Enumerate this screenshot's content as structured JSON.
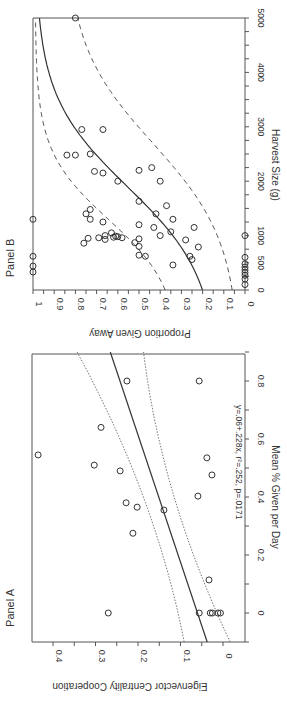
{
  "figure": {
    "orientation": "rotated 90 degrees clockwise"
  },
  "chart_data": [
    {
      "type": "scatter",
      "panel": "Panel A",
      "title": "Panel A",
      "xlabel": "Mean % Given per Day",
      "ylabel": "Eigenvector Centrality Cooperation",
      "xlim": [
        -0.1,
        0.9
      ],
      "ylim": [
        -0.04,
        0.44
      ],
      "xticks": [
        "0",
        "0.2",
        "0.4",
        "0.6",
        "0.8"
      ],
      "yticks": [
        "0",
        "0.1",
        "0.2",
        "0.3",
        "0.4"
      ],
      "annotation": "y=.06+.228x, r²=.252, p=.0171",
      "fit": {
        "type": "linear",
        "intercept": 0.06,
        "slope": 0.228,
        "line_style": "solid"
      },
      "confidence_band": {
        "line_style": "dotted"
      },
      "points": [
        {
          "x": 0.8,
          "y": 0.226
        },
        {
          "x": 0.8,
          "y": 0.056
        },
        {
          "x": 0.545,
          "y": 0.435
        },
        {
          "x": 0.64,
          "y": 0.287
        },
        {
          "x": 0.51,
          "y": 0.303
        },
        {
          "x": 0.49,
          "y": 0.242
        },
        {
          "x": 0.38,
          "y": 0.228
        },
        {
          "x": 0.365,
          "y": 0.202
        },
        {
          "x": 0.275,
          "y": 0.212
        },
        {
          "x": 0.355,
          "y": 0.139
        },
        {
          "x": 0.403,
          "y": 0.059
        },
        {
          "x": 0.535,
          "y": 0.038
        },
        {
          "x": 0.476,
          "y": 0.026
        },
        {
          "x": 0.114,
          "y": 0.033
        },
        {
          "x": 0.0,
          "y": 0.27
        },
        {
          "x": 0.0,
          "y": 0.056
        },
        {
          "x": 0.0,
          "y": 0.03
        },
        {
          "x": 0.0,
          "y": 0.025
        },
        {
          "x": 0.0,
          "y": 0.012
        },
        {
          "x": 0.0,
          "y": 0.006
        }
      ]
    },
    {
      "type": "scatter",
      "panel": "Panel B",
      "title": "Panel B",
      "xlabel": "Harvest Size (g)",
      "ylabel": "Proportion Given Away",
      "xlim": [
        0,
        5000
      ],
      "ylim": [
        0,
        1
      ],
      "xticks": [
        "0",
        "500",
        "1000",
        "2000",
        "3000",
        "4000",
        "5000"
      ],
      "yticks": [
        "0",
        "0.1",
        "0.2",
        "0.3",
        "0.4",
        "0.5",
        "0.6",
        "0.7",
        "0.8",
        "0.9",
        "1"
      ],
      "fit": {
        "type": "logistic",
        "line_style": "solid",
        "start": [
          0,
          0.22
        ],
        "end": [
          5000,
          0.95
        ]
      },
      "confidence_band": {
        "line_style": "dashed",
        "upper_start": 0.4,
        "upper_end": 0.98,
        "lower_start": 0.12,
        "lower_end": 0.68
      },
      "points": [
        {
          "x": 5000,
          "y": 0.8
        },
        {
          "x": 2950,
          "y": 0.77
        },
        {
          "x": 2950,
          "y": 0.67
        },
        {
          "x": 2480,
          "y": 0.84
        },
        {
          "x": 2480,
          "y": 0.8
        },
        {
          "x": 2500,
          "y": 0.73
        },
        {
          "x": 2180,
          "y": 0.71
        },
        {
          "x": 2150,
          "y": 0.67
        },
        {
          "x": 2000,
          "y": 0.6
        },
        {
          "x": 2200,
          "y": 0.5
        },
        {
          "x": 2250,
          "y": 0.44
        },
        {
          "x": 2000,
          "y": 0.4
        },
        {
          "x": 1630,
          "y": 0.5
        },
        {
          "x": 1550,
          "y": 0.37
        },
        {
          "x": 1480,
          "y": 0.73
        },
        {
          "x": 1400,
          "y": 0.75
        },
        {
          "x": 1300,
          "y": 0.73
        },
        {
          "x": 1250,
          "y": 0.67
        },
        {
          "x": 1400,
          "y": 0.42
        },
        {
          "x": 1300,
          "y": 0.34
        },
        {
          "x": 1200,
          "y": 0.5
        },
        {
          "x": 1150,
          "y": 0.43
        },
        {
          "x": 1150,
          "y": 0.24
        },
        {
          "x": 1070,
          "y": 0.35
        },
        {
          "x": 1050,
          "y": 0.63
        },
        {
          "x": 1000,
          "y": 0.66
        },
        {
          "x": 990,
          "y": 0.61
        },
        {
          "x": 980,
          "y": 0.6
        },
        {
          "x": 970,
          "y": 0.62
        },
        {
          "x": 960,
          "y": 0.69
        },
        {
          "x": 960,
          "y": 0.58
        },
        {
          "x": 950,
          "y": 0.74
        },
        {
          "x": 940,
          "y": 0.5
        },
        {
          "x": 930,
          "y": 0.66
        },
        {
          "x": 1000,
          "y": 0.4
        },
        {
          "x": 920,
          "y": 0.28
        },
        {
          "x": 870,
          "y": 0.52
        },
        {
          "x": 860,
          "y": 0.76
        },
        {
          "x": 800,
          "y": 0.5
        },
        {
          "x": 790,
          "y": 0.22
        },
        {
          "x": 640,
          "y": 0.5
        },
        {
          "x": 620,
          "y": 0.47
        },
        {
          "x": 620,
          "y": 0.26
        },
        {
          "x": 560,
          "y": 0.25
        },
        {
          "x": 460,
          "y": 0.34
        },
        {
          "x": 1300,
          "y": 1.0
        },
        {
          "x": 620,
          "y": 1.0
        },
        {
          "x": 440,
          "y": 1.0
        },
        {
          "x": 330,
          "y": 1.0
        },
        {
          "x": 1000,
          "y": 0.0
        },
        {
          "x": 600,
          "y": 0.0
        },
        {
          "x": 480,
          "y": 0.0
        },
        {
          "x": 420,
          "y": 0.0
        },
        {
          "x": 370,
          "y": 0.0
        },
        {
          "x": 320,
          "y": 0.0
        },
        {
          "x": 270,
          "y": 0.0
        },
        {
          "x": 200,
          "y": 0.0
        },
        {
          "x": 100,
          "y": 0.0
        }
      ]
    }
  ]
}
